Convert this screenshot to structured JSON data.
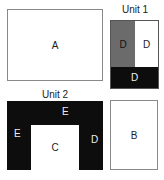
{
  "diagram": {
    "room_a": {
      "label": "A"
    },
    "room_b": {
      "label": "B"
    },
    "room_c": {
      "label": "C"
    },
    "unit1": {
      "title": "Unit 1",
      "cells": [
        {
          "label": "D",
          "fill": "#6b6b6b",
          "text_color": "#111111"
        },
        {
          "label": "D",
          "fill": "#ffffff",
          "text_color": "#222222"
        },
        {
          "label": "D",
          "fill": "#0d0d0d",
          "text_color": "#f0f0f0"
        }
      ]
    },
    "unit2": {
      "title": "Unit 2",
      "frame_fill": "#0d0d0d",
      "labels": {
        "top": "E",
        "left": "E",
        "right": "D"
      }
    }
  }
}
